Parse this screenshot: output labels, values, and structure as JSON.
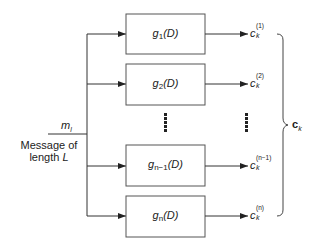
{
  "diagram": {
    "type": "block-diagram",
    "input": {
      "symbol": "m",
      "symbol_sub": "l",
      "caption_line1": "Message of",
      "caption_line2_prefix": "length ",
      "caption_line2_var": "L"
    },
    "blocks": [
      {
        "name": "g",
        "sub": "1",
        "arg": "(D)",
        "output": "c",
        "output_sub": "k",
        "output_sup": "(1)"
      },
      {
        "name": "g",
        "sub": "2",
        "arg": "(D)",
        "output": "c",
        "output_sub": "k",
        "output_sup": "(2)"
      },
      {
        "name": "g",
        "sub": "n−1",
        "arg": "(D)",
        "output": "c",
        "output_sub": "k",
        "output_sup": "(n−1)"
      },
      {
        "name": "g",
        "sub": "n",
        "arg": "(D)",
        "output": "c",
        "output_sub": "k",
        "output_sup": "(n)"
      }
    ],
    "ellipsis": "⋮",
    "combined_output": {
      "symbol": "c",
      "sub": "k"
    },
    "colors": {
      "line": "#333333",
      "box_border": "#555555",
      "background": "#ffffff"
    }
  }
}
